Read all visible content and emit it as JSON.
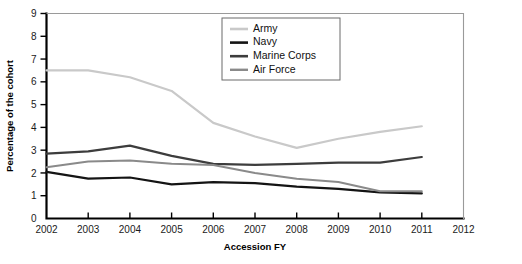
{
  "chart_data": {
    "type": "line",
    "title": "",
    "xlabel": "Accession FY",
    "ylabel": "Percentage of the cohort",
    "x": [
      2002,
      2003,
      2004,
      2005,
      2006,
      2007,
      2008,
      2009,
      2010,
      2011
    ],
    "xticklabels": [
      "2002",
      "2003",
      "2004",
      "2005",
      "2006",
      "2007",
      "2008",
      "2009",
      "2010",
      "2011",
      "2012"
    ],
    "yticklabels": [
      "0",
      "1",
      "2",
      "3",
      "4",
      "5",
      "6",
      "7",
      "8",
      "9"
    ],
    "xlim": [
      2002,
      2012
    ],
    "ylim": [
      0,
      9
    ],
    "grid": false,
    "legend_position": "top-right",
    "series": [
      {
        "name": "Army",
        "color": "#c9c9c9",
        "width": 2.2,
        "values": [
          6.5,
          6.5,
          6.2,
          5.6,
          4.2,
          3.6,
          3.1,
          3.5,
          3.8,
          4.05
        ]
      },
      {
        "name": "Navy",
        "color": "#141414",
        "width": 2.2,
        "values": [
          2.05,
          1.75,
          1.8,
          1.5,
          1.6,
          1.55,
          1.4,
          1.3,
          1.15,
          1.1
        ]
      },
      {
        "name": "Marine Corps",
        "color": "#3d3d3d",
        "width": 2.2,
        "values": [
          2.85,
          2.95,
          3.2,
          2.75,
          2.4,
          2.35,
          2.4,
          2.45,
          2.45,
          2.7
        ]
      },
      {
        "name": "Air Force",
        "color": "#8a8a8a",
        "width": 2.0,
        "values": [
          2.25,
          2.5,
          2.55,
          2.4,
          2.35,
          2.0,
          1.75,
          1.6,
          1.2,
          1.2
        ]
      }
    ]
  },
  "axis": {
    "ylabel": "Percentage of the cohort",
    "xlabel": "Accession FY"
  },
  "legend": {
    "items": [
      {
        "label": "Army"
      },
      {
        "label": "Navy"
      },
      {
        "label": "Marine Corps"
      },
      {
        "label": "Air Force"
      }
    ]
  }
}
